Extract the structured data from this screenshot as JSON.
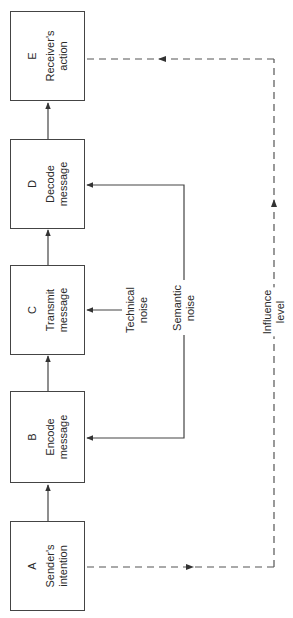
{
  "diagram": {
    "type": "communication-flow",
    "orientation": "rotated-90",
    "colors": {
      "line": "#444444",
      "text": "#2a2a2a",
      "background": "#ffffff"
    },
    "boxes": [
      {
        "id": "E",
        "letter": "E",
        "label": "Receiver's\naction"
      },
      {
        "id": "D",
        "letter": "D",
        "label": "Decode\nmessage"
      },
      {
        "id": "C",
        "letter": "C",
        "label": "Transmit\nmessage"
      },
      {
        "id": "B",
        "letter": "B",
        "label": "Encode\nmessage"
      },
      {
        "id": "A",
        "letter": "A",
        "label": "Sender's\nintention"
      }
    ],
    "labels": {
      "technical_noise": "Technical\nnoise",
      "semantic_noise": "Semantic\nnoise",
      "influence_level": "Influence level"
    },
    "edges": [
      {
        "from": "A",
        "to": "B",
        "style": "solid"
      },
      {
        "from": "B",
        "to": "C",
        "style": "solid"
      },
      {
        "from": "C",
        "to": "D",
        "style": "solid"
      },
      {
        "from": "D",
        "to": "E",
        "style": "solid"
      },
      {
        "from": "Technical noise",
        "to": "C",
        "style": "solid"
      },
      {
        "from": "Semantic noise",
        "to": "B",
        "style": "solid"
      },
      {
        "from": "Semantic noise",
        "to": "D",
        "style": "solid"
      },
      {
        "from": "A",
        "to": "E",
        "style": "dashed",
        "label": "Influence level"
      }
    ]
  }
}
